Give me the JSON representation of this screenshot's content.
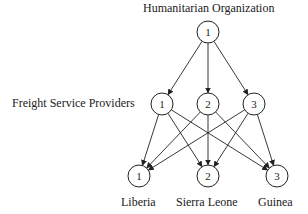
{
  "diagram": {
    "title_top": "Humanitarian Organization",
    "tier_label_middle": "Freight Service Providers",
    "top_node": {
      "label": "1",
      "cx": 208,
      "cy": 32
    },
    "middle_nodes": [
      {
        "label": "1",
        "cx": 162,
        "cy": 104
      },
      {
        "label": "2",
        "cx": 208,
        "cy": 104
      },
      {
        "label": "3",
        "cx": 254,
        "cy": 104
      }
    ],
    "bottom_nodes": [
      {
        "label": "1",
        "cx": 139,
        "cy": 176,
        "name": "Liberia"
      },
      {
        "label": "2",
        "cx": 208,
        "cy": 176,
        "name": "Sierra Leone"
      },
      {
        "label": "3",
        "cx": 277,
        "cy": 176,
        "name": "Guinea"
      }
    ],
    "node_radius": 11,
    "edges": [
      [
        "top1",
        "mid1"
      ],
      [
        "top1",
        "mid2"
      ],
      [
        "top1",
        "mid3"
      ],
      [
        "mid1",
        "bot1"
      ],
      [
        "mid1",
        "bot2"
      ],
      [
        "mid1",
        "bot3"
      ],
      [
        "mid2",
        "bot1"
      ],
      [
        "mid2",
        "bot2"
      ],
      [
        "mid2",
        "bot3"
      ],
      [
        "mid3",
        "bot1"
      ],
      [
        "mid3",
        "bot2"
      ],
      [
        "mid3",
        "bot3"
      ]
    ],
    "colors": {
      "stroke": "#222222",
      "text": "#222222",
      "background": "#ffffff"
    }
  }
}
